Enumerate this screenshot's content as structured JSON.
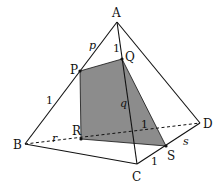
{
  "diagram": {
    "type": "tetrahedron-cross-section",
    "colors": {
      "edge": "#111111",
      "shade": "#8c8c8c",
      "background": "#ffffff"
    },
    "vertices": {
      "A": {
        "label": "A",
        "x": 117,
        "y": 22
      },
      "B": {
        "label": "B",
        "x": 25,
        "y": 144
      },
      "C": {
        "label": "C",
        "x": 137,
        "y": 164
      },
      "D": {
        "label": "D",
        "x": 200,
        "y": 123
      }
    },
    "section_points": {
      "P": {
        "label": "P",
        "x": 80,
        "y": 71
      },
      "Q": {
        "label": "Q",
        "x": 122,
        "y": 59
      },
      "R": {
        "label": "R",
        "x": 81,
        "y": 139
      },
      "S": {
        "label": "S",
        "x": 166,
        "y": 146
      }
    },
    "segment_labels": {
      "p": "p",
      "q": "q",
      "r": "r",
      "s": "s",
      "one_AQ": "1",
      "one_PB": "1",
      "one_RD": "1",
      "one_CS": "1"
    }
  }
}
